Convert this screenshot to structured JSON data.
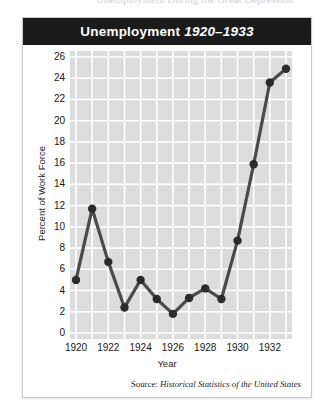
{
  "top_caption": "Unemployment During the Great Depression",
  "figure": {
    "title_main": "Unemployment",
    "title_years": "1920–1933",
    "source_label": "Source:",
    "source_title": "Historical Statistics of the United States"
  },
  "colors": {
    "title_bar": "#1b1b1b",
    "title_text": "#ffffff",
    "plot_background": "#dcdcdc",
    "gridline": "#ffffff",
    "line": "#4a4a4a",
    "marker": "#2b2b2b",
    "card_border": "#c9c9c9",
    "page_background": "#ffffff"
  },
  "chart_data": {
    "type": "line",
    "xlabel": "Year",
    "ylabel": "Percent of Work Force",
    "x": [
      1920,
      1921,
      1922,
      1923,
      1924,
      1925,
      1926,
      1927,
      1928,
      1929,
      1930,
      1931,
      1932,
      1933
    ],
    "values": [
      5.0,
      11.7,
      6.7,
      2.4,
      5.0,
      3.2,
      1.8,
      3.3,
      4.2,
      3.2,
      8.7,
      15.9,
      23.6,
      24.9
    ],
    "xlim": [
      1920,
      1933
    ],
    "ylim": [
      0,
      26
    ],
    "ytick_labels": [
      "26",
      "24",
      "22",
      "20",
      "18",
      "16",
      "14",
      "12",
      "10",
      "8",
      "6",
      "4",
      "2",
      "0"
    ],
    "ytick_values": [
      26,
      24,
      22,
      20,
      18,
      16,
      14,
      12,
      10,
      8,
      6,
      4,
      2,
      0
    ],
    "xtick_labels": [
      "1920",
      "1922",
      "1924",
      "1926",
      "1928",
      "1930",
      "1932"
    ],
    "xtick_values": [
      1920,
      1922,
      1924,
      1926,
      1928,
      1930,
      1932
    ],
    "grid": true,
    "legend": false,
    "marker": "circle",
    "source": "Historical Statistics of the United States"
  }
}
